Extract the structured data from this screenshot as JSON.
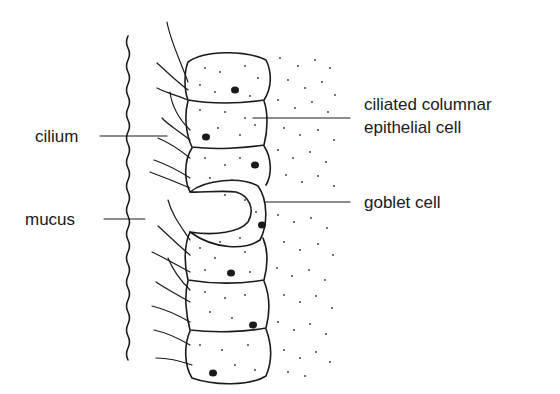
{
  "diagram": {
    "labels": {
      "cilium": "cilium",
      "mucus": "mucus",
      "ciliated_line1": "ciliated columnar",
      "ciliated_line2": "epithelial cell",
      "goblet": "goblet cell"
    },
    "colors": {
      "stroke": "#1a1a1a",
      "background": "#ffffff"
    }
  }
}
